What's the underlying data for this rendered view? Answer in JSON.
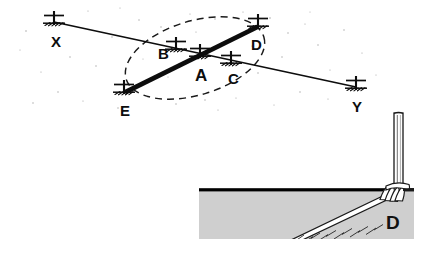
{
  "figure": {
    "background_color": "#ffffff",
    "ink_color": "#0d0d0d",
    "ground_fill_color": "#cfcfcf",
    "ground_line_color": "#000000",
    "rope_fill_color": "#ffffff"
  },
  "main_diagram": {
    "name": "plan-view",
    "markers": [
      {
        "id": "X",
        "label": "X",
        "x": 54,
        "y": 22,
        "label_x": 51,
        "label_y": 47
      },
      {
        "id": "B",
        "label": "B",
        "x": 176,
        "y": 48,
        "label_x": 158,
        "label_y": 59
      },
      {
        "id": "A",
        "label": "A",
        "x": 200,
        "y": 55,
        "label_x": 195,
        "label_y": 81
      },
      {
        "id": "C",
        "label": "C",
        "x": 231,
        "y": 62,
        "label_x": 228,
        "label_y": 84
      },
      {
        "id": "D",
        "label": "D",
        "x": 258,
        "y": 25,
        "label_x": 251,
        "label_y": 50
      },
      {
        "id": "E",
        "label": "E",
        "x": 124,
        "y": 91,
        "label_x": 120,
        "label_y": 116
      },
      {
        "id": "Y",
        "label": "Y",
        "x": 356,
        "y": 87,
        "label_x": 352,
        "label_y": 112
      }
    ],
    "lines": [
      {
        "name": "baseline-x-to-y",
        "from": "X",
        "to": "Y",
        "style": "thin-solid",
        "weight": 1.6
      },
      {
        "name": "loadline-e-to-d",
        "from": "E",
        "to": "D",
        "style": "thick-solid",
        "weight": 5
      }
    ],
    "ellipse": {
      "name": "working-area-ellipse",
      "style": "dashed",
      "cx": 195,
      "cy": 58,
      "rx": 72,
      "ry": 37,
      "rotation": -17
    }
  },
  "inset_diagram": {
    "name": "lashing-detail",
    "label": "D",
    "label_x": 392,
    "label_y": 222,
    "panel": {
      "x": 199,
      "y": 190,
      "width": 215,
      "height": 49
    },
    "ground_line_y": 190,
    "post": {
      "x": 398,
      "y_top": 113,
      "y_bottom": 198,
      "width": 9
    },
    "rope": {
      "name": "anchor-rope",
      "from_x": 292,
      "from_y": 239,
      "to_x": 390,
      "to_y": 192
    },
    "lashing_turns": 6
  }
}
